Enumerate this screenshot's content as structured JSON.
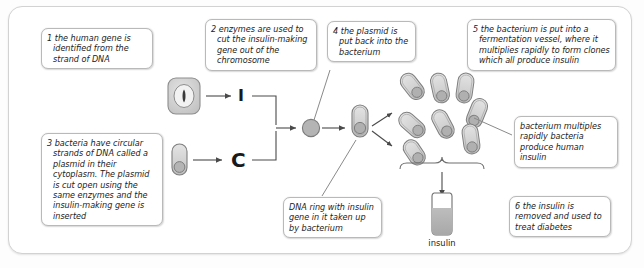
{
  "diagram": {
    "colors": {
      "frame_border": "#d2d2d2",
      "callout_border": "#b9b9b9",
      "cell_fill": "#cfcfcf",
      "bacterium_fill": "#d6d6d6",
      "plasmid_fill": "#b0b0b0",
      "line": "#6f6f6f",
      "text": "#1b1b1b"
    },
    "callouts": [
      {
        "id": "step-1",
        "number": "1",
        "text": "1 the human gene is identified from the strand of DNA"
      },
      {
        "id": "step-2",
        "number": "2",
        "text": "2 enzymes are used to cut the insulin-making gene out of the chromosome"
      },
      {
        "id": "step-3",
        "number": "3",
        "text": "3 bacteria have circular strands of DNA called a plasmid in their cytoplasm. The plasmid is cut open using the same enzymes and the insulin-making gene is inserted"
      },
      {
        "id": "step-4",
        "number": "4",
        "text": "4 the plasmid is put back into the bacterium"
      },
      {
        "id": "step-5",
        "number": "5",
        "text": "5 the bacterium is put into a fermentation vessel, where it multiplies rapidly to form clones which all produce insulin"
      },
      {
        "id": "step-6",
        "number": "6",
        "text": "6 the insulin is removed and used to treat diabetes"
      },
      {
        "id": "note-bacterium",
        "number": "",
        "text": "bacterium multiples rapidly bacteria produce human insulin"
      },
      {
        "id": "note-dna-ring",
        "number": "",
        "text": "DNA ring with insulin gene in it taken up by bacterium"
      }
    ],
    "glyphs": {
      "gene_symbol": "I",
      "plasmid_symbol": "C"
    },
    "labels": {
      "insulin_bottle": "insulin"
    }
  }
}
